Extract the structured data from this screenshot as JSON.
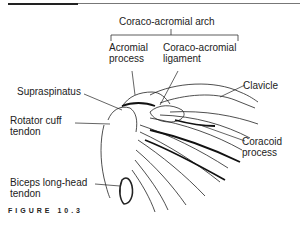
{
  "figure": {
    "title": "Coraco-acromial arch",
    "caption": "FIGURE 10.3"
  },
  "labels": {
    "acromial_process": "Acromial\nprocess",
    "coraco_acromial_ligament": "Coraco-acromial\nligament",
    "supraspinatus": "Supraspinatus",
    "clavicle": "Clavicle",
    "rotator_cuff_tendon": "Rotator cuff\ntendon",
    "coracoid_process": "Coracoid\nprocess",
    "biceps_long_head_tendon": "Biceps long-head\ntendon"
  }
}
